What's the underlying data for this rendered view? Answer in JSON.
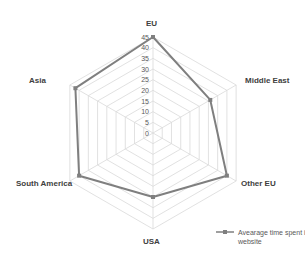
{
  "chart_data": {
    "type": "radar",
    "title": "",
    "categories": [
      "EU",
      "Middle East",
      "Other EU",
      "USA",
      "South America",
      "Asia"
    ],
    "series": [
      {
        "name": "Avearage time spent in website",
        "values": [
          45,
          31,
          40,
          30,
          40,
          42
        ],
        "color": "#7f7f7f"
      }
    ],
    "radial_axis": {
      "min": 0,
      "max": 45,
      "step": 5,
      "ticks": [
        "0",
        "5",
        "10",
        "15",
        "20",
        "25",
        "30",
        "35",
        "40",
        "45"
      ]
    },
    "grid": true,
    "legend_position": "bottom-right"
  },
  "labels": {
    "eu": "EU",
    "middle_east": "Middle East",
    "other_eu": "Other EU",
    "usa": "USA",
    "south_america": "South America",
    "asia": "Asia"
  },
  "legend": {
    "series_label": "Avearage time spent in website"
  },
  "colors": {
    "grid": "#d9d9d9",
    "series": "#7f7f7f",
    "text": "#404040"
  }
}
